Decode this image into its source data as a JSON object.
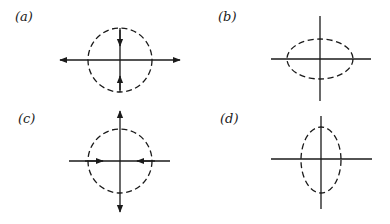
{
  "figure": {
    "panels": [
      {
        "id": "a",
        "label": "(a)",
        "label_pos": [
          15,
          10
        ],
        "axes": {
          "h": [
            60,
            180,
            60
          ],
          "v": [
            120,
            28,
            92
          ],
          "center": [
            120,
            60
          ]
        },
        "curve": {
          "shape": "circle",
          "cx": 120,
          "cy": 60,
          "rx": 32,
          "ry": 32
        },
        "arrows": [
          {
            "type": "outward-horizontal",
            "tips": [
              [
                60,
                60
              ],
              [
                180,
                60
              ]
            ]
          },
          {
            "type": "inward-vertical",
            "tips": [
              [
                120,
                46
              ],
              [
                120,
                76
              ]
            ]
          }
        ]
      },
      {
        "id": "b",
        "label": "(b)",
        "label_pos": [
          218,
          10
        ],
        "axes": {
          "h": [
            271,
            371,
            59
          ],
          "v": [
            320,
            16,
            101
          ],
          "center": [
            320,
            59
          ]
        },
        "curve": {
          "shape": "ellipse-horizontal",
          "cx": 320,
          "cy": 59,
          "rx": 33,
          "ry": 20
        },
        "arrows": []
      },
      {
        "id": "c",
        "label": "(c)",
        "label_pos": [
          18,
          112
        ],
        "axes": {
          "h": [
            69,
            170,
            161
          ],
          "v": [
            120,
            111,
            212
          ],
          "center": [
            120,
            161
          ]
        },
        "curve": {
          "shape": "circle",
          "cx": 120,
          "cy": 161,
          "rx": 32,
          "ry": 32
        },
        "arrows": [
          {
            "type": "outward-vertical",
            "tips": [
              [
                120,
                111
              ],
              [
                120,
                212
              ]
            ]
          },
          {
            "type": "inward-horizontal",
            "tips": [
              [
                103,
                161
              ],
              [
                137,
                161
              ]
            ]
          }
        ]
      },
      {
        "id": "d",
        "label": "(d)",
        "label_pos": [
          220,
          112
        ],
        "axes": {
          "h": [
            271,
            372,
            159
          ],
          "v": [
            321,
            116,
            209
          ],
          "center": [
            321,
            159
          ]
        },
        "curve": {
          "shape": "ellipse-vertical",
          "cx": 321,
          "cy": 160,
          "rx": 20,
          "ry": 33
        },
        "arrows": []
      }
    ],
    "colors": {
      "stroke": "#1a1a1a",
      "background": "#ffffff"
    }
  }
}
